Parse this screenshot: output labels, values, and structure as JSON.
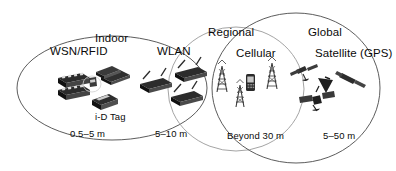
{
  "figure": {
    "type": "venn-range-diagram",
    "background": "#ffffff",
    "outline_color": "#555555",
    "text_color": "#0a0a0a"
  },
  "zones": [
    {
      "name": "indoor",
      "label": "Indoor"
    },
    {
      "name": "regional",
      "label": "Regional"
    },
    {
      "name": "global",
      "label": "Global"
    }
  ],
  "technologies": [
    {
      "name": "wsn-rfid",
      "label": "WSN/RFID",
      "range": "0.5–5 m",
      "sublabel": "i-D Tag",
      "icons": [
        "sensor-node-icon",
        "sensor-node-icon",
        "rfid-tag-icon",
        "rfid-tag-icon",
        "id-tag-icon"
      ]
    },
    {
      "name": "wlan",
      "label": "WLAN",
      "range": "5–10 m",
      "sublabel": "",
      "icons": [
        "wifi-router-icon",
        "wifi-router-icon",
        "wifi-router-icon"
      ]
    },
    {
      "name": "cellular",
      "label": "Cellular",
      "range": "Beyond 30 m",
      "sublabel": "",
      "icons": [
        "cell-tower-icon",
        "cell-tower-icon",
        "cell-tower-icon",
        "mobile-phone-icon"
      ]
    },
    {
      "name": "satellite-gps",
      "label": "Satellite (GPS)",
      "range": "5–50 m",
      "sublabel": "",
      "icons": [
        "satellite-icon",
        "satellite-icon",
        "satellite-icon",
        "satellite-icon"
      ]
    }
  ]
}
